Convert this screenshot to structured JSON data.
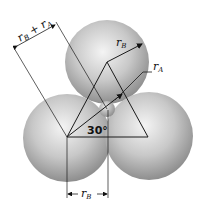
{
  "figure": {
    "type": "geometry-diagram",
    "labels": {
      "dim_top_left": {
        "main": "r",
        "sub1": "B",
        "plus": " + ",
        "main2": "r",
        "sub2": "A"
      },
      "radius_B_top": {
        "main": "r",
        "sub": "B"
      },
      "radius_A": {
        "main": "r",
        "sub": "A"
      },
      "angle": "30°",
      "dim_bottom": {
        "main": "r",
        "sub": "B"
      }
    },
    "colors": {
      "sphere_light": "#f2f2f2",
      "sphere_mid": "#bdbdbd",
      "sphere_dark": "#8c8c8c",
      "line": "#1a1a1a"
    }
  }
}
